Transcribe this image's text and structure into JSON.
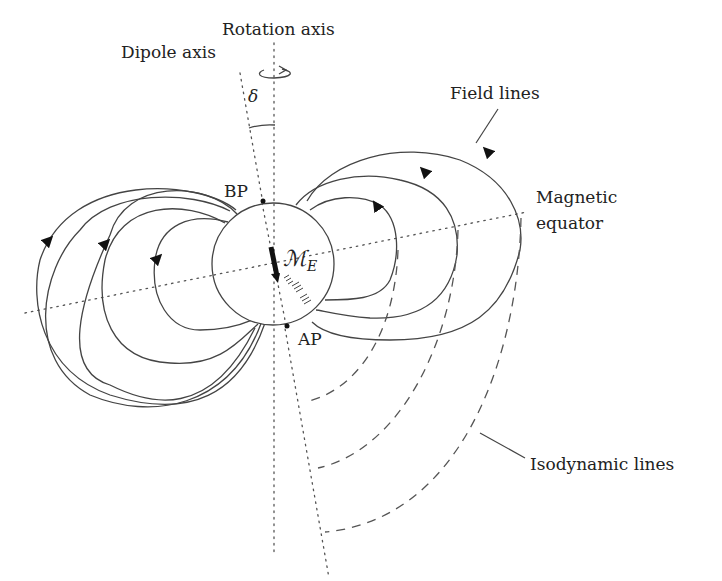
{
  "diagram": {
    "labels": {
      "rotation_axis": "Rotation axis",
      "dipole_axis": "Dipole axis",
      "delta": "δ",
      "field_lines": "Field lines",
      "magnetic_equator_1": "Magnetic",
      "magnetic_equator_2": "equator",
      "bp": "BP",
      "ap": "AP",
      "moment_main": "ℳ",
      "moment_sub": "E",
      "isodynamic_lines": "Isodynamic lines"
    },
    "elements": {
      "earth": {
        "cx": 273,
        "cy": 264,
        "r": 61
      },
      "field_line_count_per_side": 3,
      "isodynamic_line_count": 3
    },
    "colors": {
      "line": "#444444",
      "background": "#ffffff"
    }
  }
}
